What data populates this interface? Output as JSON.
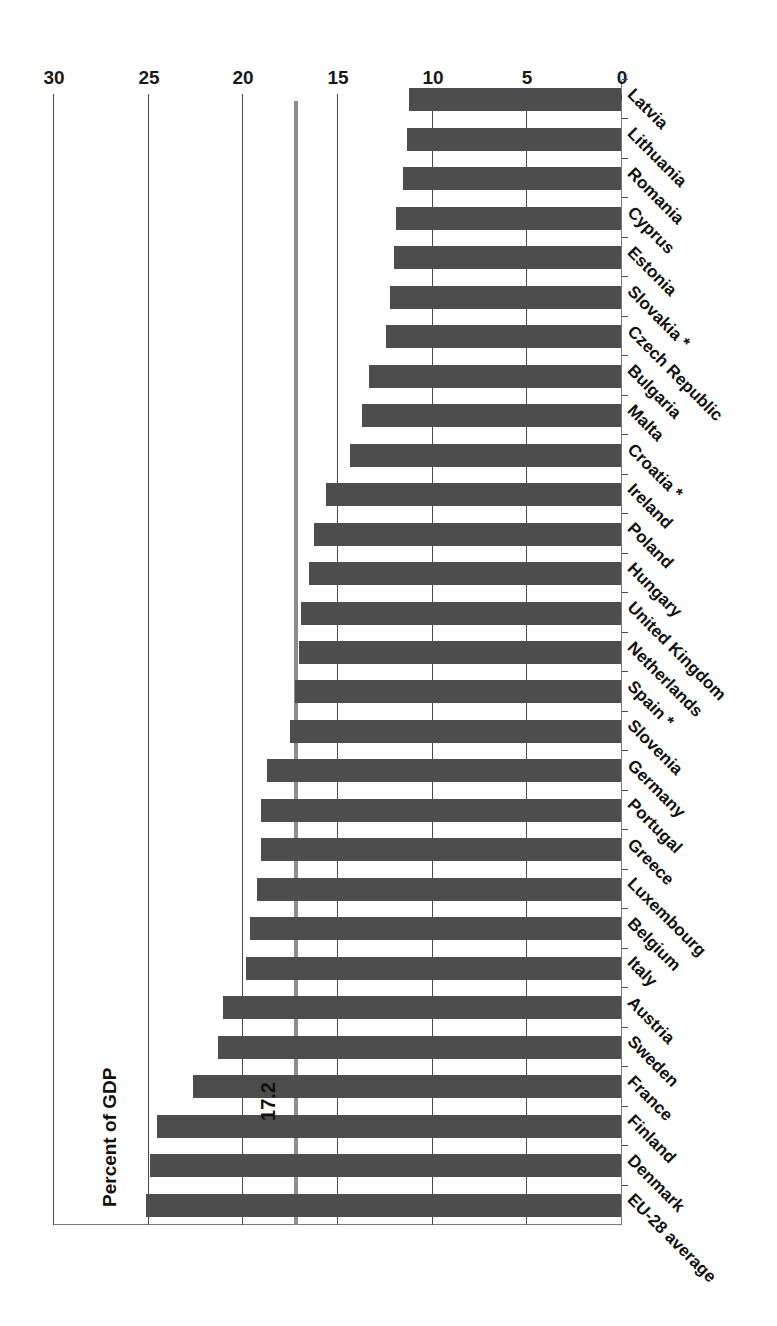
{
  "chart_data": {
    "type": "bar",
    "orientation": "horizontal",
    "title": "",
    "xlabel": "",
    "ylabel": "Percent of GDP",
    "axis_title": "Percent of GDP",
    "value_axis_range": [
      0,
      30
    ],
    "tick_labels": [
      "0",
      "5",
      "10",
      "15",
      "20",
      "25",
      "30"
    ],
    "tick_values": [
      0,
      5,
      10,
      15,
      20,
      25,
      30
    ],
    "grid": true,
    "legend": "none",
    "annotations": [
      {
        "label": "17.2",
        "value": 17.2,
        "kind": "reference-line",
        "name": "eu28-average-line"
      }
    ],
    "categories": [
      "Latvia",
      "Lithuania",
      "Romania",
      "Cyprus",
      "Estonia",
      "Slovakia *",
      "Czech Republic",
      "Bulgaria",
      "Malta",
      "Croatia *",
      "Ireland",
      "Poland",
      "Hungary",
      "United Kingdom",
      "Netherlands",
      "Spain *",
      "Slovenia",
      "Germany",
      "Portugal",
      "Greece",
      "Luxembourg",
      "Belgium",
      "Italy",
      "Austria",
      "Sweden",
      "France",
      "Finland",
      "Denmark",
      "EU-28 average"
    ],
    "values": [
      11.2,
      11.3,
      11.5,
      11.9,
      12.0,
      12.2,
      12.4,
      13.3,
      13.7,
      14.3,
      15.6,
      16.2,
      16.5,
      16.9,
      17.0,
      17.2,
      17.5,
      18.7,
      19.0,
      19.0,
      19.2,
      19.6,
      19.8,
      21.0,
      21.3,
      22.6,
      24.5,
      24.9,
      25.1
    ],
    "series": [
      {
        "name": "Percent of GDP",
        "values": [
          11.2,
          11.3,
          11.5,
          11.9,
          12.0,
          12.2,
          12.4,
          13.3,
          13.7,
          14.3,
          15.6,
          16.2,
          16.5,
          16.9,
          17.0,
          17.2,
          17.5,
          18.7,
          19.0,
          19.0,
          19.2,
          19.6,
          19.8,
          21.0,
          21.3,
          22.6,
          24.5,
          24.9,
          25.1
        ],
        "color": "#4d4d4d"
      }
    ],
    "colors": {
      "bar": "#4d4d4d",
      "gridline": "#4a4a4a",
      "average_line": "#8c8c8c",
      "text": "#111111",
      "background": "#ffffff"
    }
  }
}
